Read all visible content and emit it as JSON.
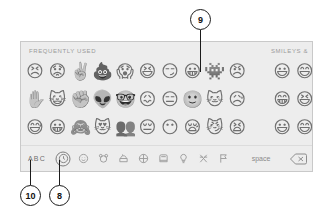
{
  "panel": {
    "section_left_label": "FREQUENTLY USED",
    "section_right_label": "SMILEYS &",
    "background_color": "#ededed",
    "border_color": "#c9c9c9"
  },
  "emoji_grid": {
    "rows": [
      [
        "😣",
        "😟",
        "✌️",
        "💩",
        "😱",
        "😆",
        "😏",
        "😀",
        "👾",
        "😠",
        "",
        "😃",
        "😄"
      ],
      [
        "✋",
        "😺",
        "✊",
        "👽",
        "🤓",
        "😖",
        "😑",
        "🙂",
        "🐱",
        "😥",
        "",
        "😁",
        "😆"
      ],
      [
        "😅",
        "😀",
        "🙈",
        "😻",
        "👥",
        "😔",
        "😶",
        "😪",
        "😼",
        "😫",
        "",
        "😃",
        "😄"
      ]
    ]
  },
  "toolbar": {
    "abc_label": "ABC",
    "space_label": "space",
    "categories": [
      {
        "name": "recent",
        "icon": "clock-icon",
        "selected": true
      },
      {
        "name": "smileys",
        "icon": "smiley-icon",
        "selected": false
      },
      {
        "name": "animals",
        "icon": "bear-icon",
        "selected": false
      },
      {
        "name": "food",
        "icon": "food-icon",
        "selected": false
      },
      {
        "name": "activity",
        "icon": "ball-icon",
        "selected": false
      },
      {
        "name": "travel",
        "icon": "car-icon",
        "selected": false
      },
      {
        "name": "objects",
        "icon": "bulb-icon",
        "selected": false
      },
      {
        "name": "symbols",
        "icon": "symbols-icon",
        "selected": false
      },
      {
        "name": "flags",
        "icon": "flag-icon",
        "selected": false
      }
    ],
    "delete_icon": "delete-backspace-icon",
    "dismiss_icon": "dismiss-keyboard-icon"
  },
  "callouts": [
    {
      "id": "9",
      "number": "9",
      "target": "emoji-grinning-face"
    },
    {
      "id": "10",
      "number": "10",
      "target": "abc-key"
    },
    {
      "id": "8",
      "number": "8",
      "target": "recent-category-icon"
    }
  ]
}
